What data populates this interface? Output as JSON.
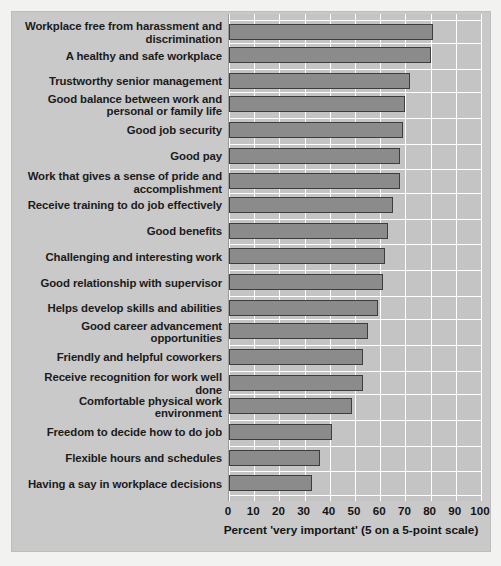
{
  "chart_data": {
    "type": "bar",
    "orientation": "horizontal",
    "title": "",
    "xlabel": "Percent 'very important' (5 on a 5-point scale)",
    "ylabel": "",
    "xlim": [
      0,
      100
    ],
    "xticks": [
      0,
      10,
      20,
      30,
      40,
      50,
      60,
      70,
      80,
      90,
      100
    ],
    "grid": true,
    "legend": false,
    "bar_color": "#8b8b8b",
    "bar_border_color": "#3d3d3d",
    "plot_background": "#c4c4c4",
    "panel_background": "#c9c9c9",
    "gridline_color": "#ffffff",
    "categories": [
      "Workplace free from harassment and discrimination",
      "A healthy and safe workplace",
      "Trustworthy senior management",
      "Good balance between work and personal or family life",
      "Good job security",
      "Good pay",
      "Work that gives a sense of pride and accomplishment",
      "Receive training to do job effectively",
      "Good benefits",
      "Challenging and interesting work",
      "Good relationship with supervisor",
      "Helps develop skills and abilities",
      "Good career advancement opportunities",
      "Friendly and helpful coworkers",
      "Receive recognition for work well done",
      "Comfortable physical work environment",
      "Freedom to decide how to do job",
      "Flexible hours and schedules",
      "Having a say in workplace decisions"
    ],
    "values": [
      81,
      80,
      72,
      70,
      69,
      68,
      68,
      65,
      63,
      62,
      61,
      59,
      55,
      53,
      53,
      49,
      41,
      36,
      33
    ]
  }
}
